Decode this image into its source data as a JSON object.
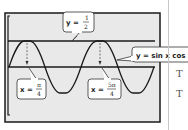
{
  "figure": {
    "type": "graphing-calculator-screen",
    "screen_fill": "#e9e9e9",
    "border_color": "#1a1a1a",
    "curve_color": "#1a1a1a",
    "function_label": "y = sin x cos x",
    "horizontal_line_label": {
      "lhs": "y =",
      "num": "1",
      "den": "2"
    },
    "intersections": [
      {
        "lhs": "x =",
        "num": "π",
        "den": "4"
      },
      {
        "lhs": "x =",
        "num": "5π",
        "den": "4"
      }
    ]
  },
  "margin": {
    "letters": [
      "T",
      "T"
    ]
  }
}
